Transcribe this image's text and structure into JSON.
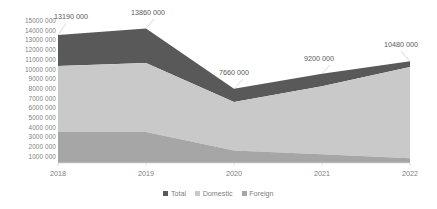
{
  "chart_data": {
    "type": "area",
    "stacked": true,
    "title": "",
    "xlabel": "",
    "ylabel": "",
    "categories": [
      "2018",
      "2019",
      "2020",
      "2021",
      "2022"
    ],
    "x_tick_labels": [
      "2018",
      "2019",
      "2020",
      "2021",
      "2022"
    ],
    "y_tick_labels": [
      "15000 000",
      "14000 000",
      "13000 000",
      "12000 000",
      "11000 000",
      "10000 000",
      "9000 000",
      "8000 000",
      "7000 000",
      "6000 000",
      "5000 000",
      "4000 000",
      "3000 000",
      "2000 000",
      "1000 000"
    ],
    "y_tick_values": [
      15000000,
      14000000,
      13000000,
      12000000,
      11000000,
      10000000,
      9000000,
      8000000,
      7000000,
      6000000,
      5000000,
      4000000,
      3000000,
      2000000,
      1000000
    ],
    "ylim": [
      0,
      15000000
    ],
    "grid": false,
    "legend_position": "bottom",
    "series": [
      {
        "name": "Total",
        "color": "#595959",
        "values": [
          13190000,
          13860000,
          7660000,
          9200000,
          10480000
        ]
      },
      {
        "name": "Domestic",
        "color": "#c9c9c9",
        "values": [
          6800000,
          7100000,
          5000000,
          7000000,
          9400000
        ]
      },
      {
        "name": "Foreign",
        "color": "#a6a6a6",
        "values": [
          3200000,
          3200000,
          1300000,
          900000,
          500000
        ]
      }
    ],
    "stack_tops": {
      "foreign": [
        3200000,
        3200000,
        1300000,
        900000,
        500000
      ],
      "domestic": [
        10000000,
        10300000,
        6300000,
        7900000,
        9900000
      ],
      "total": [
        13190000,
        13860000,
        7660000,
        9200000,
        10480000
      ]
    },
    "data_labels": [
      {
        "text": "13190 000",
        "series": "Total",
        "category": "2018"
      },
      {
        "text": "13860 000",
        "series": "Total",
        "category": "2019"
      },
      {
        "text": "7660 000",
        "series": "Total",
        "category": "2020"
      },
      {
        "text": "9200 000",
        "series": "Total",
        "category": "2021"
      },
      {
        "text": "10480 000",
        "series": "Total",
        "category": "2022"
      }
    ],
    "legend": [
      {
        "label": "Total",
        "color": "#595959"
      },
      {
        "label": "Domestic",
        "color": "#c9c9c9"
      },
      {
        "label": "Foreign",
        "color": "#a6a6a6"
      }
    ]
  }
}
